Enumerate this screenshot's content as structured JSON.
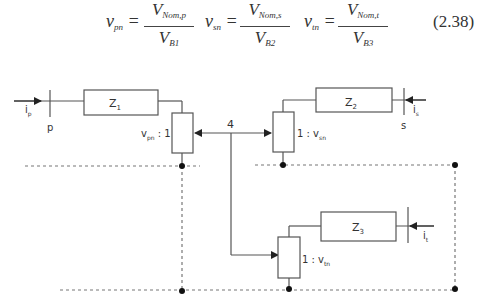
{
  "equation": {
    "number": "(2.38)",
    "terms": [
      {
        "lhs": "v",
        "lhs_sub": "pn",
        "num": "V",
        "num_sub": "Nom,p",
        "den": "V",
        "den_sub": "B1"
      },
      {
        "lhs": "v",
        "lhs_sub": "sn",
        "num": "V",
        "num_sub": "Nom,s",
        "den": "V",
        "den_sub": "B2"
      },
      {
        "lhs": "v",
        "lhs_sub": "tn",
        "num": "V",
        "num_sub": "Nom,t",
        "den": "V",
        "den_sub": "B3"
      }
    ]
  },
  "diagram": {
    "impedances": {
      "z1": "Z",
      "z1_sub": "1",
      "z2": "Z",
      "z2_sub": "2",
      "z3": "Z",
      "z3_sub": "3"
    },
    "currents": {
      "ip": "i",
      "ip_sub": "p",
      "is": "i",
      "is_sub": "s",
      "it": "i",
      "it_sub": "t"
    },
    "ports": {
      "p": "p",
      "s": "s"
    },
    "node": "4",
    "transformers": {
      "primary": {
        "label": "v",
        "sub": "pn",
        "suffix": " : 1"
      },
      "secondary": {
        "prefix": "1 : v",
        "sub": "sn"
      },
      "tertiary": {
        "prefix": "1 : v",
        "sub": "tn"
      }
    }
  }
}
